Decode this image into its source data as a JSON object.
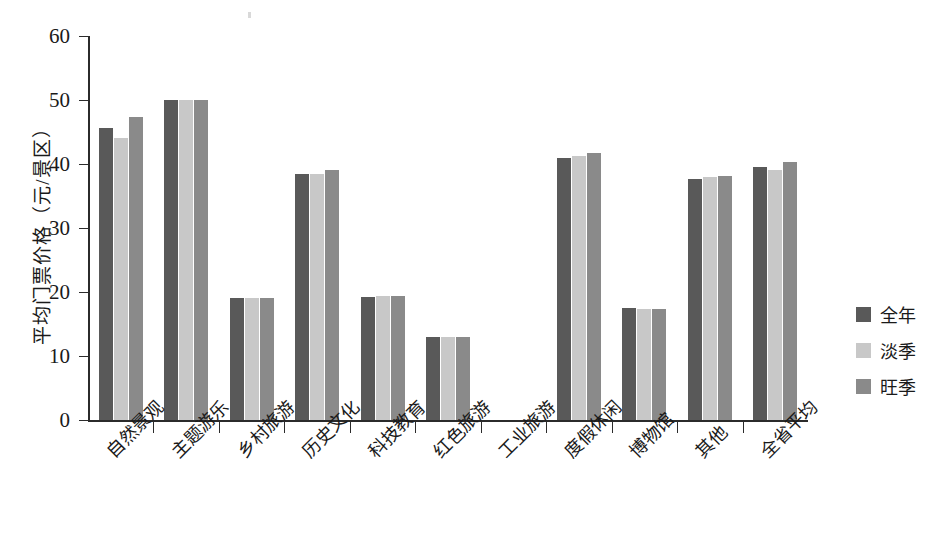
{
  "chart_data": {
    "type": "bar",
    "title": "",
    "subtitle": "",
    "xlabel": "",
    "ylabel": "平均门票价格（元/景区）",
    "ylim": [
      0,
      60
    ],
    "yticks": [
      0,
      10,
      20,
      30,
      40,
      50,
      60
    ],
    "grid": false,
    "legend_position": "right",
    "categories": [
      "自然景观",
      "主题游乐",
      "乡村旅游",
      "历史文化",
      "科技教育",
      "红色旅游",
      "工业旅游",
      "度假休闲",
      "博物馆",
      "其他",
      "全省平均"
    ],
    "series": [
      {
        "name": "全年",
        "color": "#595959",
        "values": [
          45.6,
          50.0,
          19.0,
          38.5,
          19.2,
          13.0,
          0.0,
          41.0,
          17.5,
          37.7,
          39.5
        ]
      },
      {
        "name": "淡季",
        "color": "#c8c8c8",
        "values": [
          44.0,
          50.0,
          19.0,
          38.4,
          19.3,
          12.9,
          0.0,
          41.2,
          17.4,
          37.9,
          39.0
        ]
      },
      {
        "name": "旺季",
        "color": "#8a8a8a",
        "values": [
          47.4,
          50.0,
          19.0,
          39.0,
          19.3,
          12.9,
          0.0,
          41.7,
          17.4,
          38.2,
          40.3
        ]
      }
    ]
  },
  "legend": {
    "items": [
      {
        "label": "全年"
      },
      {
        "label": "淡季"
      },
      {
        "label": "旺季"
      }
    ]
  },
  "caption": {
    "text": ""
  }
}
